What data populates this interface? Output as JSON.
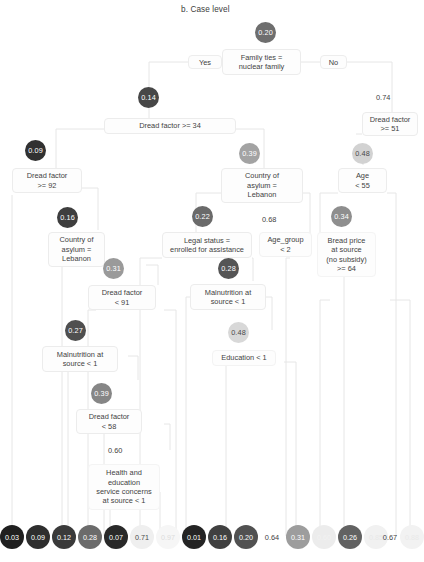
{
  "figure": {
    "title": "b. Case level",
    "type": "decision-tree",
    "footnote": ""
  },
  "palette": {
    "edge": "#e3e3e3",
    "box_border": "#ececec",
    "box_fill": "#fdfdfd",
    "text": "#3f3f3f"
  },
  "branch_labels": {
    "yes": "Yes",
    "no": "No"
  },
  "nodes": [
    {
      "id": "n-root",
      "value": "0.20",
      "condition": "Family ties =\nnuclear family",
      "fill": "#6e6e6e",
      "text_color": "#ffffff"
    },
    {
      "id": "n-dread34",
      "value": "0.14",
      "condition": "Dread factor >= 34",
      "fill": "#474747",
      "text_color": "#ffffff"
    },
    {
      "id": "n-dread51",
      "value": "0.74",
      "condition": "Dread factor\n>= 51",
      "fill": "#fbfbfb",
      "text_color": "#4a4a4a"
    },
    {
      "id": "n-dread92",
      "value": "0.09",
      "condition": "Dread factor\n>= 92",
      "fill": "#313131",
      "text_color": "#ffffff"
    },
    {
      "id": "n-country39",
      "value": "0.39",
      "condition": "Country of\nasylum =\nLebanon",
      "fill": "#a3a3a3",
      "text_color": "#ffffff"
    },
    {
      "id": "n-age55",
      "value": "0.48",
      "condition": "Age\n< 55",
      "fill": "#d2d2d2",
      "text_color": "#4a4a4a"
    },
    {
      "id": "n-country16",
      "value": "0.16",
      "condition": "Country of\nasylum =\nLebanon",
      "fill": "#3e3e3e",
      "text_color": "#ffffff"
    },
    {
      "id": "n-legal22",
      "value": "0.22",
      "condition": "Legal status =\nenrolled for assistance",
      "fill": "#6a6a6a",
      "text_color": "#ffffff"
    },
    {
      "id": "n-bread34",
      "value": "0.34",
      "condition": "Bread price\nat source\n(no subsidy)\n>= 64",
      "fill": "#8e8e8e",
      "text_color": "#ffffff"
    },
    {
      "id": "n-dread91",
      "value": "0.31",
      "condition": "Dread factor\n< 91",
      "fill": "#9a9a9a",
      "text_color": "#ffffff"
    },
    {
      "id": "n-malnut28",
      "value": "0.28",
      "condition": "Malnutrition at\nsource < 1",
      "fill": "#555555",
      "text_color": "#ffffff"
    },
    {
      "id": "n-malnut27",
      "value": "0.27",
      "condition": "Malnutrition at\nsource < 1",
      "fill": "#4f4f4f",
      "text_color": "#ffffff"
    },
    {
      "id": "n-edu48",
      "value": "0.48",
      "condition": "Education < 1",
      "fill": "#d8d8d8",
      "text_color": "#4a4a4a"
    },
    {
      "id": "n-dread58",
      "value": "0.39",
      "condition": "Dread factor\n< 58",
      "fill": "#868686",
      "text_color": "#ffffff"
    },
    {
      "id": "n-health60",
      "value": "0.60",
      "condition": "Health and\neducation\nservice concerns\nat source < 1",
      "fill": "#ffffff",
      "text_color": "#3f3f3f"
    },
    {
      "id": "n-agegroup",
      "value": "0.68",
      "condition": "Age_group\n< 2",
      "fill": "#ffffff",
      "text_color": "#3f3f3f"
    }
  ],
  "leaves": [
    {
      "id": "leaf-1",
      "value": "0.03",
      "fill": "#1f1f1f",
      "text_color": "#ffffff",
      "bubble": true
    },
    {
      "id": "leaf-2",
      "value": "0.09",
      "fill": "#2e2e2e",
      "text_color": "#ffffff",
      "bubble": true
    },
    {
      "id": "leaf-3",
      "value": "0.12",
      "fill": "#3a3a3a",
      "text_color": "#ffffff",
      "bubble": true
    },
    {
      "id": "leaf-4",
      "value": "0.28",
      "fill": "#6b6b6b",
      "text_color": "#ffffff",
      "bubble": true
    },
    {
      "id": "leaf-5",
      "value": "0.07",
      "fill": "#292929",
      "text_color": "#ffffff",
      "bubble": true
    },
    {
      "id": "leaf-6",
      "value": "0.71",
      "fill": "#efefef",
      "text_color": "#4a4a4a",
      "bubble": true
    },
    {
      "id": "leaf-7",
      "value": "0.97",
      "fill": "#f6f6f6",
      "text_color": "#dedede",
      "bubble": true
    },
    {
      "id": "leaf-8",
      "value": "0.01",
      "fill": "#242424",
      "text_color": "#ffffff",
      "bubble": true
    },
    {
      "id": "leaf-9",
      "value": "0.16",
      "fill": "#404040",
      "text_color": "#ffffff",
      "bubble": true
    },
    {
      "id": "leaf-10",
      "value": "0.20",
      "fill": "#515151",
      "text_color": "#ffffff",
      "bubble": true
    },
    {
      "id": "leaf-11",
      "value": "0.64",
      "fill": "#ffffff",
      "text_color": "#3f3f3f",
      "bubble": false
    },
    {
      "id": "leaf-12",
      "value": "0.31",
      "fill": "#9d9d9d",
      "text_color": "#ffffff",
      "bubble": true
    },
    {
      "id": "leaf-13",
      "value": "0.60",
      "fill": "#e9e9e9",
      "text_color": "#efefef",
      "bubble": true
    },
    {
      "id": "leaf-14",
      "value": "0.26",
      "fill": "#626262",
      "text_color": "#ffffff",
      "bubble": true
    },
    {
      "id": "leaf-15",
      "value": "0.85",
      "fill": "#f1f1f1",
      "text_color": "#e8e8e8",
      "bubble": true
    },
    {
      "id": "leaf-16",
      "value": "0.67",
      "fill": "#ffffff",
      "text_color": "#3f3f3f",
      "bubble": false
    },
    {
      "id": "leaf-17",
      "value": "0.88",
      "fill": "#f2f2f2",
      "text_color": "#e9e9e9",
      "bubble": true
    }
  ]
}
